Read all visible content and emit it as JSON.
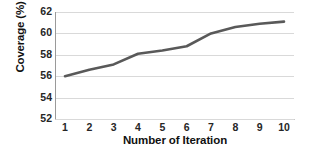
{
  "chart_data": {
    "type": "line",
    "title": "",
    "xlabel": "Number of Iteration",
    "ylabel": "Coverage (%)",
    "x": [
      1,
      2,
      3,
      4,
      5,
      6,
      7,
      8,
      9,
      10
    ],
    "xticklabels": [
      "1",
      "2",
      "3",
      "4",
      "5",
      "6",
      "7",
      "8",
      "9",
      "10"
    ],
    "yticklabels": [
      "52",
      "54",
      "56",
      "58",
      "60",
      "62"
    ],
    "yticks": [
      52,
      54,
      56,
      58,
      60,
      62
    ],
    "values": [
      56.0,
      56.6,
      57.1,
      58.1,
      58.4,
      58.8,
      60.0,
      60.6,
      60.9,
      61.1
    ],
    "series": [
      {
        "name": "Coverage",
        "values": [
          56.0,
          56.6,
          57.1,
          58.1,
          58.4,
          58.8,
          60.0,
          60.6,
          60.9,
          61.1
        ]
      }
    ],
    "xlim": [
      1,
      10
    ],
    "ylim": [
      52,
      62
    ],
    "grid": "horizontal",
    "legend": "none",
    "line_color": "#595959",
    "grid_color": "#d9d9d9",
    "axis_color": "#9a9a9a",
    "background": "#ffffff"
  }
}
